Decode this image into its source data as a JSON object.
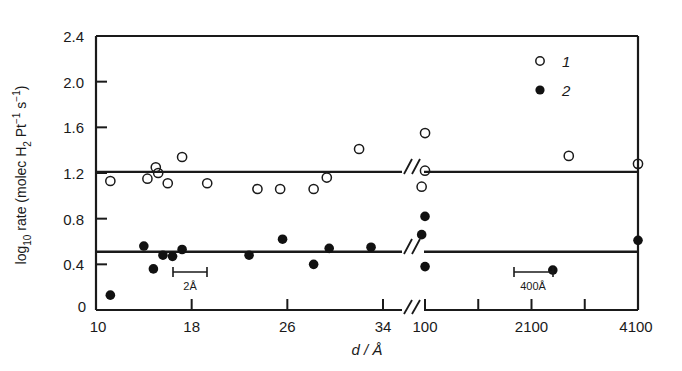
{
  "chart_data": {
    "type": "scatter",
    "title": "",
    "xlabel": "d / Å",
    "ylabel": "log10 rate (molec H2 Pt-1 s-1)",
    "ylabel_parts": {
      "prefix": "log",
      "sub1": "10",
      "mid": " rate (molec H",
      "sub2": "2",
      "mid2": " Pt",
      "sup1": "−1",
      "mid3": " s",
      "sup2": "−1",
      "suffix": ")"
    },
    "ylim": [
      0,
      2.4
    ],
    "yticks": [
      "0",
      "0.4",
      "0.8",
      "1.2",
      "1.6",
      "2.0",
      "2.4"
    ],
    "ytick_values": [
      0,
      0.4,
      0.8,
      1.2,
      1.6,
      2.0,
      2.4
    ],
    "xticks": [
      "10",
      "18",
      "26",
      "34",
      "100",
      "2100",
      "4100"
    ],
    "xtick_values": [
      10,
      18,
      26,
      34,
      100,
      2100,
      4100
    ],
    "axis_break": {
      "present": true,
      "between": [
        34,
        100
      ],
      "symbol": "//"
    },
    "grid": false,
    "legend_position": "top-right",
    "series": [
      {
        "name": "1",
        "marker": "open-circle",
        "color": "#1a1a1a",
        "points": [
          {
            "x": 11.2,
            "y": 1.13
          },
          {
            "x": 14.3,
            "y": 1.15
          },
          {
            "x": 15.0,
            "y": 1.25
          },
          {
            "x": 15.2,
            "y": 1.2
          },
          {
            "x": 16.0,
            "y": 1.11
          },
          {
            "x": 17.2,
            "y": 1.34
          },
          {
            "x": 19.3,
            "y": 1.11
          },
          {
            "x": 23.5,
            "y": 1.06
          },
          {
            "x": 25.4,
            "y": 1.06
          },
          {
            "x": 28.2,
            "y": 1.06
          },
          {
            "x": 29.3,
            "y": 1.16
          },
          {
            "x": 32.0,
            "y": 1.41
          },
          {
            "x": 37.0,
            "y": 1.08
          },
          {
            "x": 100.0,
            "y": 1.22
          },
          {
            "x": 101.0,
            "y": 1.55
          },
          {
            "x": 2800.0,
            "y": 1.35
          },
          {
            "x": 4100.0,
            "y": 1.28
          }
        ]
      },
      {
        "name": "2",
        "marker": "filled-circle",
        "color": "#111111",
        "points": [
          {
            "x": 11.2,
            "y": 0.13
          },
          {
            "x": 14.0,
            "y": 0.56
          },
          {
            "x": 14.8,
            "y": 0.36
          },
          {
            "x": 15.6,
            "y": 0.48
          },
          {
            "x": 16.4,
            "y": 0.47
          },
          {
            "x": 17.2,
            "y": 0.53
          },
          {
            "x": 22.8,
            "y": 0.48
          },
          {
            "x": 25.6,
            "y": 0.62
          },
          {
            "x": 28.2,
            "y": 0.4
          },
          {
            "x": 29.5,
            "y": 0.54
          },
          {
            "x": 33.0,
            "y": 0.55
          },
          {
            "x": 37.5,
            "y": 0.66
          },
          {
            "x": 100.0,
            "y": 0.82
          },
          {
            "x": 101.0,
            "y": 0.38
          },
          {
            "x": 2500.0,
            "y": 0.35
          },
          {
            "x": 4100.0,
            "y": 0.61
          }
        ]
      }
    ],
    "trend_lines": [
      {
        "name": "series-1-trend",
        "y": 1.21,
        "style": "solid"
      },
      {
        "name": "series-2-trend",
        "y": 0.51,
        "style": "solid"
      }
    ],
    "scale_bars": [
      {
        "name": "scale-bar-left",
        "label": "2Å"
      },
      {
        "name": "scale-bar-right",
        "label": "400Å"
      }
    ],
    "legend": [
      {
        "label": "1",
        "marker": "open-circle"
      },
      {
        "label": "2",
        "marker": "filled-circle"
      }
    ]
  }
}
